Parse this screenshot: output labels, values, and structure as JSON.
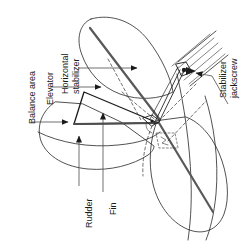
{
  "figure": {
    "orientation": "labels rotated 90 degrees (read bottom-to-top)",
    "background_color": "#ffffff",
    "line_color": "#1a1a1a",
    "accent_line_color": "#4d4d4d",
    "text_color": "#1a1a1a"
  },
  "labels": {
    "balance_area": "Balance area",
    "elevator": "Elevator",
    "horizontal_stabilizer_line1": "Horizontal",
    "horizontal_stabilizer_line2": "stabilizer",
    "stabilizer_jackscrew_line1": "Stabilizer",
    "stabilizer_jackscrew_line2": "jackscrew",
    "rudder": "Rudder",
    "fin": "Fin"
  },
  "callouts": [
    {
      "id": "balance-area",
      "label": "Balance area",
      "arrow_direction": "right"
    },
    {
      "id": "elevator",
      "label": "Elevator",
      "arrow_direction": "right"
    },
    {
      "id": "horizontal-stabilizer",
      "label": "Horizontal stabilizer",
      "arrow_direction": "right"
    },
    {
      "id": "stabilizer-jackscrew",
      "label": "Stabilizer jackscrew",
      "arrow_direction": "left"
    },
    {
      "id": "rudder",
      "label": "Rudder",
      "arrow_direction": "up"
    },
    {
      "id": "fin",
      "label": "Fin",
      "arrow_direction": "up"
    }
  ]
}
